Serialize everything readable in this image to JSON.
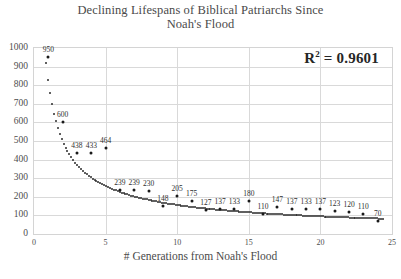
{
  "chart_data": {
    "type": "scatter",
    "title": "Declining Lifespans of Biblical Patriarchs Since Noah's Flood",
    "title_line1": "Declining Lifespans of Biblical Patriarchs Since",
    "title_line2": "Noah's Flood",
    "xlabel": "# Generations from Noah's Flood",
    "ylabel": "",
    "xlim": [
      0,
      25
    ],
    "ylim": [
      0,
      1000
    ],
    "xticks": [
      "0",
      "5",
      "10",
      "15",
      "20",
      "25"
    ],
    "yticks": [
      "0",
      "100",
      "200",
      "300",
      "400",
      "500",
      "600",
      "700",
      "800",
      "900",
      "1000"
    ],
    "grid": true,
    "legend": "none",
    "annotations": [
      {
        "name": "r-squared",
        "text_prefix": "R",
        "text_sup": "2",
        "text_suffix": " = 0.9601",
        "value": 0.9601
      }
    ],
    "marker_color": "#1a1a1a",
    "gridline_color": "#d9d9d9",
    "points": [
      {
        "x": 1,
        "y": 950,
        "label": "950"
      },
      {
        "x": 2,
        "y": 600,
        "label": "600"
      },
      {
        "x": 3,
        "y": 438,
        "label": "438"
      },
      {
        "x": 4,
        "y": 433,
        "label": "433"
      },
      {
        "x": 5,
        "y": 464,
        "label": "464"
      },
      {
        "x": 6,
        "y": 239,
        "label": "239"
      },
      {
        "x": 7,
        "y": 239,
        "label": "239"
      },
      {
        "x": 8,
        "y": 230,
        "label": "230"
      },
      {
        "x": 9,
        "y": 148,
        "label": "148"
      },
      {
        "x": 10,
        "y": 205,
        "label": "205"
      },
      {
        "x": 11,
        "y": 175,
        "label": "175"
      },
      {
        "x": 12,
        "y": 127,
        "label": "127"
      },
      {
        "x": 13,
        "y": 137,
        "label": "137"
      },
      {
        "x": 14,
        "y": 133,
        "label": "133"
      },
      {
        "x": 15,
        "y": 180,
        "label": "180"
      },
      {
        "x": 16,
        "y": 110,
        "label": "110"
      },
      {
        "x": 17,
        "y": 147,
        "label": "147"
      },
      {
        "x": 18,
        "y": 137,
        "label": "137"
      },
      {
        "x": 19,
        "y": 133,
        "label": "133"
      },
      {
        "x": 20,
        "y": 137,
        "label": "137"
      },
      {
        "x": 21,
        "y": 123,
        "label": "123"
      },
      {
        "x": 22,
        "y": 120,
        "label": "120"
      },
      {
        "x": 23,
        "y": 110,
        "label": "110"
      },
      {
        "x": 24,
        "y": 70,
        "label": "70"
      }
    ],
    "trendline": {
      "type": "power",
      "coefficient": 820,
      "exponent": -0.72,
      "r_squared": 0.9601
    }
  }
}
